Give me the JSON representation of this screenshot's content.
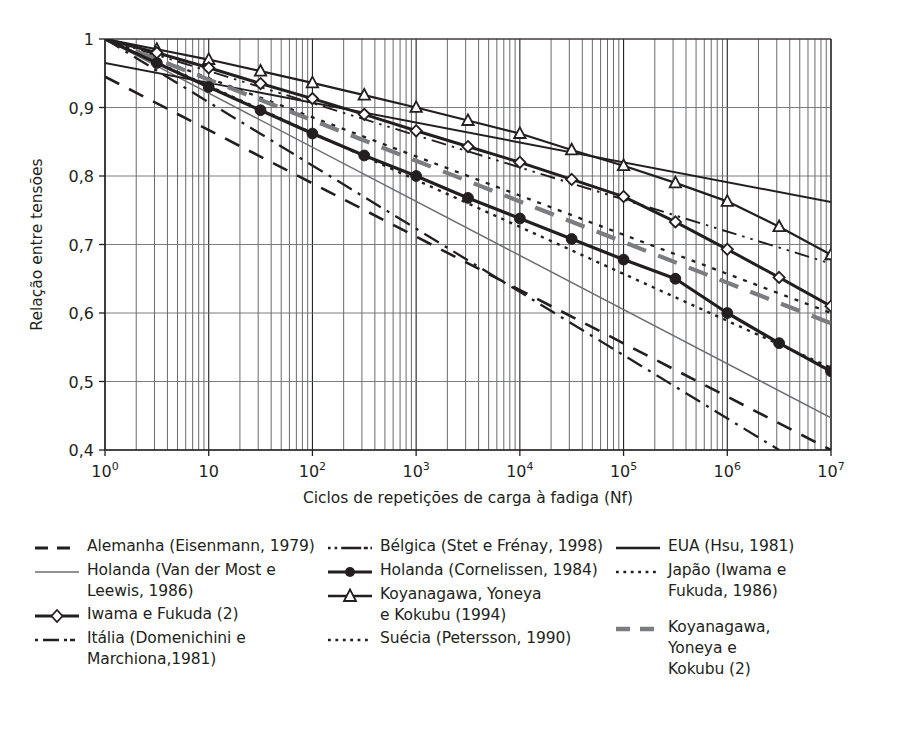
{
  "chart_data": {
    "type": "line",
    "title": "",
    "xlabel": "Ciclos de repetições de carga à fadiga (Nf)",
    "ylabel": "Relação entre tensões",
    "xscale": "log",
    "xlim": [
      1,
      10000000
    ],
    "ylim": [
      0.4,
      1.0
    ],
    "grid": true,
    "x_tick_labels": [
      "10⁰",
      "10",
      "10²",
      "10³",
      "10⁴",
      "10⁵",
      "10⁶",
      "10⁷"
    ],
    "x_tick_bases": [
      "10",
      "10",
      "10",
      "10",
      "10",
      "10",
      "10",
      "10"
    ],
    "x_tick_exponents": [
      "0",
      "",
      "2",
      "3",
      "4",
      "5",
      "6",
      "7"
    ],
    "y_tick_labels": [
      "0,4",
      "0,5",
      "0,6",
      "0,7",
      "0,8",
      "0,9",
      "1"
    ],
    "y_tick_values": [
      0.4,
      0.5,
      0.6,
      0.7,
      0.8,
      0.9,
      1.0
    ],
    "legend_position": "below",
    "series": [
      {
        "name": "Alemanha (Eisenmann, 1979)",
        "style": "dashed",
        "color": "#231f20",
        "width": 2.6,
        "marker": "none",
        "x": [
          1,
          10000000
        ],
        "y": [
          0.945,
          0.4
        ]
      },
      {
        "name": "Bélgica (Stet e Frénay, 1998)",
        "style": "dash-dot-dot",
        "color": "#231f20",
        "width": 1.9,
        "marker": "none",
        "x": [
          1,
          10000000
        ],
        "y": [
          1.0,
          0.672
        ]
      },
      {
        "name": "EUA (Hsu, 1981)",
        "style": "solid",
        "color": "#231f20",
        "width": 1.9,
        "marker": "none",
        "x": [
          1,
          10000000
        ],
        "y": [
          0.965,
          0.762
        ]
      },
      {
        "name": "Holanda (Van der Most e Leewis, 1986)",
        "style": "solid-thin",
        "color": "#6d6e71",
        "width": 1.5,
        "marker": "none",
        "x": [
          1,
          10000000
        ],
        "y": [
          1.0,
          0.447
        ]
      },
      {
        "name": "Holanda (Cornelissen, 1984)",
        "style": "solid",
        "color": "#231f20",
        "width": 3.2,
        "marker": "circle-filled",
        "x": [
          1,
          3.16,
          10,
          31.6,
          100,
          316,
          1000,
          3160,
          10000,
          31600,
          100000,
          316000,
          1000000,
          3160000,
          10000000
        ],
        "y": [
          1.0,
          0.965,
          0.93,
          0.896,
          0.862,
          0.83,
          0.8,
          0.768,
          0.738,
          0.708,
          0.678,
          0.65,
          0.6,
          0.556,
          0.515
        ]
      },
      {
        "name": "Japão (Iwama e Fukuda, 1986)",
        "style": "dotted",
        "color": "#231f20",
        "width": 2.3,
        "marker": "none",
        "x": [
          1,
          10000000
        ],
        "y": [
          1.0,
          0.6
        ]
      },
      {
        "name": "Iwama e Fukuda (2)",
        "style": "solid",
        "color": "#231f20",
        "width": 3.0,
        "marker": "diamond-open",
        "x": [
          1,
          3.16,
          10,
          31.6,
          100,
          316,
          1000,
          3160,
          10000,
          31600,
          100000,
          316000,
          1000000,
          3160000,
          10000000
        ],
        "y": [
          1.0,
          0.98,
          0.958,
          0.935,
          0.913,
          0.89,
          0.866,
          0.843,
          0.82,
          0.795,
          0.77,
          0.733,
          0.693,
          0.652,
          0.61
        ]
      },
      {
        "name": "Koyanagawa, Yoneya e Kokubu (1994)",
        "style": "solid",
        "color": "#231f20",
        "width": 2.2,
        "marker": "triangle-open",
        "x": [
          1,
          3.16,
          10,
          31.6,
          100,
          316,
          1000,
          3160,
          10000,
          31600,
          100000,
          316000,
          1000000,
          3160000,
          10000000
        ],
        "y": [
          1.0,
          0.985,
          0.97,
          0.953,
          0.936,
          0.918,
          0.9,
          0.881,
          0.862,
          0.838,
          0.815,
          0.79,
          0.763,
          0.726,
          0.685
        ]
      },
      {
        "name": "Koyanagawa, Yoneya e Kokubu (2)",
        "style": "dashed-gray",
        "color": "#7a7c7f",
        "width": 4.2,
        "marker": "none",
        "x": [
          1,
          10000000
        ],
        "y": [
          1.0,
          0.585
        ]
      },
      {
        "name": "Itália (Domenichini e Marchiona,1981)",
        "style": "dash-dot",
        "color": "#231f20",
        "width": 2.3,
        "marker": "none",
        "x": [
          1,
          3160000
        ],
        "y": [
          1.0,
          0.4
        ]
      },
      {
        "name": "Suécia (Petersson, 1990)",
        "style": "dotted-fine",
        "color": "#231f20",
        "width": 2.4,
        "marker": "none",
        "x": [
          1,
          10000000
        ],
        "y": [
          1.0,
          0.52
        ]
      }
    ]
  },
  "axes": {
    "y_title": "Relação entre tensões",
    "x_title": "Ciclos de repetições de carga à fadiga (Nf)",
    "y_ticks": [
      "1",
      "0,9",
      "0,8",
      "0,7",
      "0,6",
      "0,5",
      "0,4"
    ],
    "x_ticks": [
      {
        "base": "10",
        "exp": "0"
      },
      {
        "base": "10",
        "exp": ""
      },
      {
        "base": "10",
        "exp": "2"
      },
      {
        "base": "10",
        "exp": "3"
      },
      {
        "base": "10",
        "exp": "4"
      },
      {
        "base": "10",
        "exp": "5"
      },
      {
        "base": "10",
        "exp": "6"
      },
      {
        "base": "10",
        "exp": "7"
      }
    ]
  },
  "legend": {
    "columns": [
      {
        "items": [
          {
            "label": "Alemanha (Eisenmann, 1979)",
            "sample": "dashed",
            "name": "legend-alemanha"
          },
          {
            "label": "Holanda (Van der Most e\nLeewis, 1986)",
            "sample": "solid-thin-gray",
            "name": "legend-holanda-vandermost"
          },
          {
            "label": "Iwama e Fukuda (2)",
            "sample": "solid-diamond",
            "name": "legend-iwama-fukuda"
          },
          {
            "label": "Itália (Domenichini e\nMarchiona,1981)",
            "sample": "dash-dot",
            "name": "legend-italia"
          }
        ]
      },
      {
        "items": [
          {
            "label": "Bélgica (Stet e Frénay, 1998)",
            "sample": "dash-dot-dot",
            "name": "legend-belgica"
          },
          {
            "label": "Holanda (Cornelissen, 1984)",
            "sample": "solid-circle",
            "name": "legend-holanda-cornelissen"
          },
          {
            "label": "Koyanagawa, Yoneya\ne Kokubu (1994)",
            "sample": "solid-triangle",
            "name": "legend-koyanagawa-1994"
          },
          {
            "label": "Suécia (Petersson, 1990)",
            "sample": "dotted-fine",
            "name": "legend-suecia"
          }
        ]
      },
      {
        "items": [
          {
            "label": "EUA (Hsu, 1981)",
            "sample": "solid-thick",
            "name": "legend-eua"
          },
          {
            "label": "Japão (Iwama e\nFukuda, 1986)",
            "sample": "dotted-fine",
            "name": "legend-japao"
          },
          {
            "label": "Koyanagawa,\nYoneya e\nKokubu (2)",
            "sample": "dashed-gray",
            "name": "legend-koyanagawa-2",
            "gap": true
          }
        ]
      }
    ]
  }
}
